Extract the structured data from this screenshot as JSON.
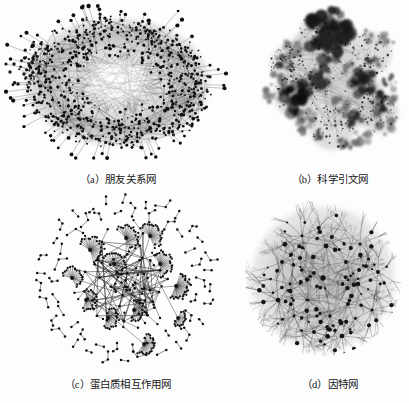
{
  "figure": {
    "background_color": "#fdfdfd",
    "ink_color": "#111111",
    "edge_color": "#6b6b6b",
    "layout": "2x2 grid of network visualizations",
    "panels": [
      {
        "id": "a",
        "caption": "（a）朋友关系网",
        "caption_latin": "(a)",
        "caption_cjk": "朋友关系网",
        "network_type": "friendship-network",
        "description": "dense hairball with light lens-shaped void at center",
        "node_color": "#101010",
        "edge_color": "#707070"
      },
      {
        "id": "b",
        "caption": "（b）科学引文网",
        "caption_latin": "(b)",
        "caption_cjk": "科学引文网",
        "network_type": "scientific-citation-network",
        "description": "clustered dark and gray blobs of varying density",
        "node_color": "#151515",
        "edge_color": "#9a9a9a"
      },
      {
        "id": "c",
        "caption": "（c）蛋白质相互作用网",
        "caption_latin": "(c)",
        "caption_cjk": "蛋白质相互作用网",
        "network_type": "protein-interaction-network",
        "description": "hub-and-spoke fan clusters in core, ring of isolated dumbbell components outside",
        "node_color": "#111111",
        "edge_color": "#333333"
      },
      {
        "id": "d",
        "caption": "（d）因特网",
        "caption_latin": "(d)",
        "caption_cjk": "因特网",
        "network_type": "internet-topology",
        "description": "circular fractal radial burst of fine branching filaments",
        "node_color": "#141414",
        "edge_color": "#8c8c8c"
      }
    ]
  },
  "chart_data": {
    "type": "diagram",
    "title": "",
    "subtitle": "",
    "panel_count": 4,
    "grid": [
      2,
      2
    ],
    "panels": [
      {
        "label": "（a）朋友关系网",
        "kind": "force-directed hairball",
        "approx_nodes": 900,
        "approx_edges": 3000,
        "structure": "single giant component, annular density with central void, few isolated nodes at left"
      },
      {
        "label": "（b）科学引文网",
        "kind": "clustered blob map",
        "approx_nodes": 1500,
        "approx_edges": 4000,
        "structure": "modular communities rendered as dark/light blobs"
      },
      {
        "label": "（c）蛋白质相互作用网",
        "kind": "hub-and-spoke with isolates",
        "approx_nodes": 420,
        "approx_edges": 500,
        "structure": "central connected core of star-shaped hubs plus outer ring of small disconnected components"
      },
      {
        "label": "（d）因特网",
        "kind": "radial fractal tree",
        "approx_nodes": 5000,
        "approx_edges": 6000,
        "structure": "circular burst of fine branching filaments with dark hub dots"
      }
    ]
  }
}
